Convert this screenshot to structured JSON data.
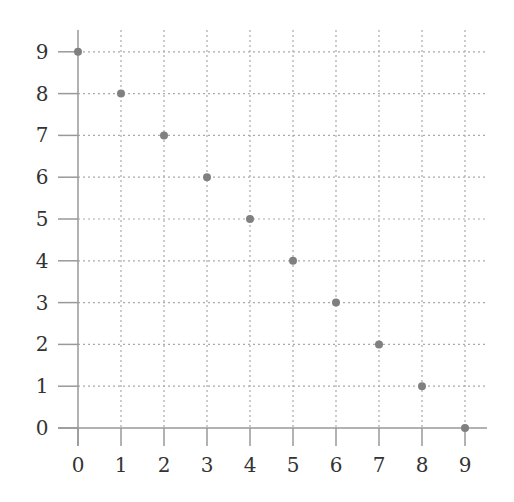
{
  "chart_data": {
    "type": "scatter",
    "title": "",
    "xlabel": "",
    "ylabel": "",
    "x": [
      0,
      1,
      2,
      3,
      4,
      5,
      6,
      7,
      8,
      9
    ],
    "y": [
      9,
      8,
      7,
      6,
      5,
      4,
      3,
      2,
      1,
      0
    ],
    "series": [
      {
        "name": "points",
        "x": [
          0,
          1,
          2,
          3,
          4,
          5,
          6,
          7,
          8,
          9
        ],
        "y": [
          9,
          8,
          7,
          6,
          5,
          4,
          3,
          2,
          1,
          0
        ]
      }
    ],
    "xlim": [
      0,
      9
    ],
    "ylim": [
      0,
      9
    ],
    "xticks": [
      "0",
      "1",
      "2",
      "3",
      "4",
      "5",
      "6",
      "7",
      "8",
      "9"
    ],
    "yticks": [
      "0",
      "1",
      "2",
      "3",
      "4",
      "5",
      "6",
      "7",
      "8",
      "9"
    ],
    "grid": true,
    "grid_style": "dotted",
    "legend": null,
    "colors": {
      "point": "#808080",
      "axis": "#999999",
      "grid": "#aaaaaa",
      "text": "#333333"
    }
  }
}
